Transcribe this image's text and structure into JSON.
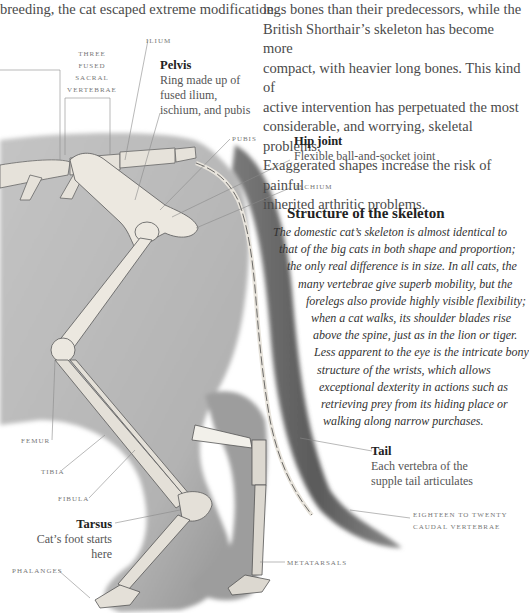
{
  "top_left_text": "breeding, the cat escaped extreme modification.",
  "top_right_paragraph": [
    "legs bones than their predecessors, while the",
    "British Shorthair’s skeleton has become more",
    "compact, with heavier long bones. This kind of",
    "active intervention has perpetuated the most",
    "considerable, and worrying, skeletal problems.",
    "Exaggerated shapes increase the risk of painful",
    "inherited arthritic problems."
  ],
  "labels": {
    "ilium": "ILIUM",
    "sacral": [
      "THREE",
      "FUSED",
      "SACRAL",
      "VERTEBRAE"
    ],
    "pelvis_title": "Pelvis",
    "pelvis_desc": [
      "Ring made up of",
      "fused ilium,",
      "ischium, and pubis"
    ],
    "pubis": "PUBIS",
    "hip_title": "Hip joint",
    "hip_desc": "Flexible ball-and-socket joint",
    "ischium": "ISCHIUM",
    "femur": "FEMUR",
    "tibia": "TIBIA",
    "fibula": "FIBULA",
    "tarsus_title": "Tarsus",
    "tarsus_desc": "Cat’s foot starts here",
    "phalanges": "PHALANGES",
    "tail_title": "Tail",
    "tail_desc": [
      "Each vertebra of the",
      "supple tail articulates"
    ],
    "caudal": [
      "EIGHTEEN TO TWENTY",
      "CAUDAL VERTEBRAE"
    ],
    "metatarsals": "METATARSALS"
  },
  "structure": {
    "title": "Structure of the skeleton",
    "lines": [
      "The domestic cat’s skeleton is almost identical to",
      "that of the big cats in both shape and proportion;",
      "the only real difference is in size. In all cats, the",
      "many vertebrae give superb mobility, but the",
      "forelegs also provide highly visible flexibility;",
      "when a cat walks, its shoulder blades rise",
      "above the spine, just as in the lion or tiger.",
      "Less apparent to the eye is the intricate bony",
      "structure of the wrists, which allows",
      "exceptional dexterity in actions such as",
      "retrieving prey from its hiding place or",
      "walking along narrow purchases."
    ]
  },
  "colors": {
    "fur": "#b9b9b9",
    "fur_dark": "#5a5a5a",
    "bone": "#ece8e0",
    "bone_outline": "#6a6a6a",
    "leader_line": "#8a8a8a"
  }
}
